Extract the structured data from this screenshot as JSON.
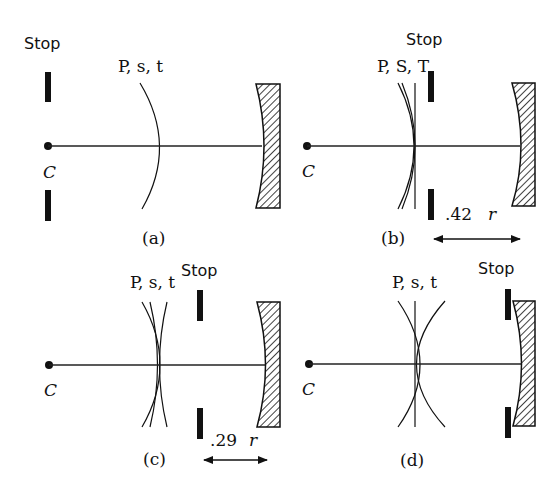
{
  "figure": {
    "panels": [
      {
        "id": "a",
        "caption": "(a)",
        "stop_label": "Stop",
        "surfaces_label": "P, s, t",
        "center_label": "C",
        "description": "Stop at center of curvature; single curved focal surface"
      },
      {
        "id": "b",
        "caption": "(b)",
        "stop_label": "Stop",
        "surfaces_label": "P, S, T",
        "center_label": "C",
        "distance_label": ".42",
        "distance_unit": "r",
        "description": "Stop at 0.42r from mirror; flat tangential field"
      },
      {
        "id": "c",
        "caption": "(c)",
        "stop_label": "Stop",
        "surfaces_label": "P, s, t",
        "center_label": "C",
        "distance_label": ".29",
        "distance_unit": "r",
        "description": "Stop at 0.29r from mirror"
      },
      {
        "id": "d",
        "caption": "(d)",
        "stop_label": "Stop",
        "surfaces_label": "P, s, t",
        "center_label": "C",
        "description": "Stop at mirror"
      }
    ]
  }
}
